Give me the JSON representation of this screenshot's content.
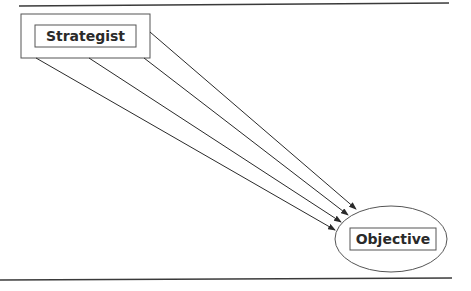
{
  "diagram": {
    "nodes": [
      {
        "id": "strategist",
        "label": "Strategist",
        "shape": "double-rectangle"
      },
      {
        "id": "objective",
        "label": "Objective",
        "shape": "ellipse-with-rectangle"
      }
    ],
    "edges": [
      {
        "from": "strategist",
        "to": "objective",
        "count": 4,
        "style": "arrow"
      }
    ],
    "colors": {
      "line": "#2a2a2a",
      "background": "#ffffff"
    }
  }
}
